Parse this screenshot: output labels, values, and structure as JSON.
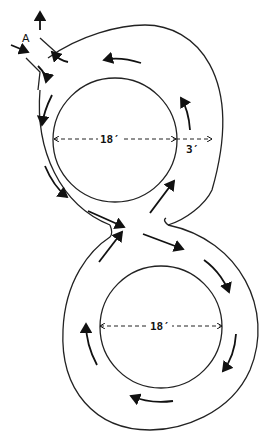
{
  "diagram": {
    "type": "figure-eight track plan",
    "entrance_label": "A",
    "top_loop": {
      "inner_diameter_label": "18′",
      "track_width_label": "3′"
    },
    "bottom_loop": {
      "inner_diameter_label": "18′"
    },
    "flow": "one-way traffic indicated by arrows; crossing at center of figure eight",
    "colors": {
      "line": "#222222",
      "background": "#ffffff"
    }
  }
}
